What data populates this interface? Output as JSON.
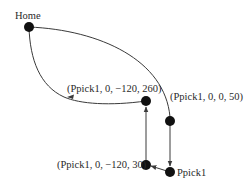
{
  "diagram": {
    "type": "robot-path",
    "colors": {
      "line": "#3a3a3a",
      "node": "#111111",
      "text": "#2a2a2a",
      "background": "#ffffff"
    },
    "nodes": [
      {
        "id": "home",
        "label": "Home",
        "x": 29,
        "y": 27
      },
      {
        "id": "approach",
        "label": "(Ppick1, 0, 0, 50)",
        "x": 170,
        "y": 121
      },
      {
        "id": "pick",
        "label": "Ppick1",
        "x": 170,
        "y": 172
      },
      {
        "id": "shift",
        "label": "(Ppick1, 0, −120, 30)",
        "x": 146,
        "y": 165
      },
      {
        "id": "lift",
        "label": "(Ppick1, 0, −120, 260)",
        "x": 146,
        "y": 101
      }
    ],
    "edges": [
      {
        "from": "home",
        "to": "approach",
        "shape": "curve"
      },
      {
        "from": "approach",
        "to": "pick",
        "shape": "straight"
      },
      {
        "from": "pick",
        "to": "shift",
        "shape": "straight"
      },
      {
        "from": "shift",
        "to": "lift",
        "shape": "straight"
      },
      {
        "from": "lift",
        "to": "home",
        "shape": "curve"
      }
    ]
  }
}
